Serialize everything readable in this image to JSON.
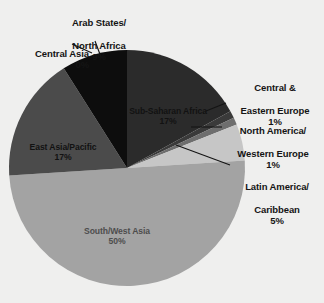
{
  "chart_data": {
    "type": "pie",
    "title": "",
    "subtitle": "",
    "xlabel": "",
    "ylabel": "",
    "legend_position": "none",
    "grid": false,
    "units": "percent",
    "categories": [
      "Sub-Saharan Africa",
      "Central & Eastern Europe",
      "North America/Western Europe",
      "Latin America/Caribbean",
      "South/West Asia",
      "East Asia/Pacific",
      "Central Asia",
      "Arab States/North Africa"
    ],
    "values": [
      17,
      1,
      1,
      5,
      50,
      17,
      0,
      9
    ],
    "slices": [
      {
        "name": "Sub-Saharan Africa",
        "label": "Sub-Saharan Africa",
        "value": 17,
        "percent_label": "17%",
        "color": "#2b2b2b",
        "label_placement": "inside",
        "label_color": "#121212"
      },
      {
        "name": "Central & Eastern Europe",
        "label": "Central &\nEastern Europe",
        "value": 1,
        "percent_label": "1%",
        "color": "#3a3a3a",
        "label_placement": "callout",
        "label_color": "#141414"
      },
      {
        "name": "North America/Western Europe",
        "label": "North America/\nWestern Europe",
        "value": 1,
        "percent_label": "1%",
        "color": "#6e6e6e",
        "label_placement": "callout",
        "label_color": "#141414"
      },
      {
        "name": "Latin America/Caribbean",
        "label": "Latin America/\nCaribbean",
        "value": 5,
        "percent_label": "5%",
        "color": "#c6c6c6",
        "label_placement": "callout",
        "label_color": "#141414"
      },
      {
        "name": "South/West Asia",
        "label": "South/West Asia",
        "value": 50,
        "percent_label": "50%",
        "color": "#a3a3a3",
        "label_placement": "inside",
        "label_color": "#4d4d4d"
      },
      {
        "name": "East Asia/Pacific",
        "label": "East Asia/Pacific",
        "value": 17,
        "percent_label": "17%",
        "color": "#4b4b4b",
        "label_placement": "inside",
        "label_color": "#121212"
      },
      {
        "name": "Central Asia",
        "label": "Central Asia",
        "value": 0,
        "percent_label": "0%",
        "color": "#4b4b4b",
        "label_placement": "callout",
        "label_color": "#141414"
      },
      {
        "name": "Arab States/North Africa",
        "label": "Arab States/\nNorth Africa",
        "value": 9,
        "percent_label": "9%",
        "color": "#0d0d0d",
        "label_placement": "callout",
        "label_color": "#141414"
      }
    ],
    "background_color": "#efefee",
    "leader_line_color": "#141414"
  },
  "labels": {
    "sub_saharan": {
      "name": "Sub-Saharan Africa",
      "pct": "17%"
    },
    "central_eastern_europe": {
      "line1": "Central &",
      "line2": "Eastern Europe",
      "pct": "1%"
    },
    "north_america_western_europe": {
      "line1": "North America/",
      "line2": "Western Europe",
      "pct": "1%"
    },
    "latin_america_caribbean": {
      "line1": "Latin America/",
      "line2": "Caribbean",
      "pct": "5%"
    },
    "south_west_asia": {
      "name": "South/West Asia",
      "pct": "50%"
    },
    "east_asia_pacific": {
      "name": "East Asia/Pacific",
      "pct": "17%"
    },
    "central_asia": {
      "name": "Central Asia",
      "pct": "0%"
    },
    "arab_states_north_africa": {
      "line1": "Arab States/",
      "line2": "North Africa",
      "pct": "9%"
    }
  }
}
